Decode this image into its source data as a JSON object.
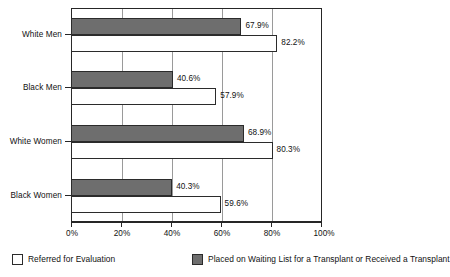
{
  "chart_data": {
    "type": "bar",
    "orientation": "horizontal",
    "title": "",
    "subtitle": "",
    "xlabel": "",
    "ylabel": "",
    "xlim": [
      0,
      100
    ],
    "xticks": [
      "0%",
      "20%",
      "40%",
      "60%",
      "80%",
      "100%"
    ],
    "xtick_values": [
      0,
      20,
      40,
      60,
      80,
      100
    ],
    "grid": true,
    "grid_axis": "x",
    "legend_position": "bottom",
    "value_suffix": "%",
    "categories": [
      "White Men",
      "Black Men",
      "White Women",
      "Black Women"
    ],
    "series": [
      {
        "name": "Placed on Waiting List for a Transplant or Received a Transplant",
        "color": "#6e6e6e",
        "values": [
          67.9,
          40.6,
          68.9,
          40.3
        ],
        "labels": [
          "67.9%",
          "40.6%",
          "68.9%",
          "40.3%"
        ]
      },
      {
        "name": "Referred for Evaluation",
        "color": "#ffffff",
        "values": [
          82.2,
          57.9,
          80.3,
          59.6
        ],
        "labels": [
          "82.2%",
          "57.9%",
          "80.3%",
          "59.6%"
        ]
      }
    ]
  },
  "legend": {
    "items": [
      {
        "label": "Referred for Evaluation",
        "swatch": "hollow"
      },
      {
        "label": "Placed on Waiting List for a Transplant or Received a Transplant",
        "swatch": "filled"
      }
    ]
  },
  "axis": {
    "y_categories": [
      "White Men",
      "Black Men",
      "White Women",
      "Black Women"
    ],
    "x_ticks": [
      "0%",
      "20%",
      "40%",
      "60%",
      "80%",
      "100%"
    ]
  },
  "colors": {
    "bar_filled": "#6e6e6e",
    "bar_hollow": "#ffffff",
    "frame": "#262626",
    "grid": "#9a9a9a",
    "text": "#111111"
  }
}
